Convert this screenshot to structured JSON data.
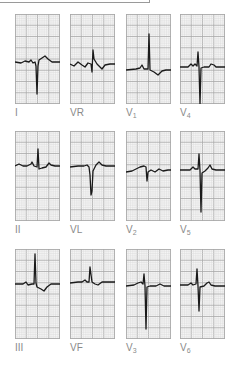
{
  "figure": {
    "grid_color_minor": "#d9d9d9",
    "grid_color_major": "#a8a8a8",
    "trace_color": "#1a1a1a",
    "label_color": "#8a8a8a"
  },
  "leads": [
    {
      "id": "I",
      "name": "I",
      "sub": "",
      "x": 15,
      "y": 14,
      "label_y": 108,
      "baseline": 48,
      "trace": "M0,48 L6,49 L10,47 L14,48 L16,46 L18,49 L20,48 L21,52 L22,80 L23,52 L24,46 L27,44 L30,42 L33,45 L37,48 L45,48"
    },
    {
      "id": "VR",
      "name": "VR",
      "sub": "",
      "x": 70,
      "y": 14,
      "label_y": 108,
      "baseline": 50,
      "trace": "M0,50 L4,52 L8,48 L12,51 L15,53 L18,49 L21,50 L22,58 L23,36 L24,45 L27,50 L32,55 L35,51 L40,50 L45,50"
    },
    {
      "id": "V1",
      "name": "V",
      "sub": "1",
      "x": 126,
      "y": 14,
      "label_y": 108,
      "baseline": 55,
      "trace": "M0,56 L10,55 L14,54 L16,51 L18,55 L22,55 L23,20 L24,56 L28,58 L32,61 L36,57 L40,56 L45,56"
    },
    {
      "id": "V4",
      "name": "V",
      "sub": "4",
      "x": 180,
      "y": 14,
      "label_y": 108,
      "baseline": 53,
      "trace": "M0,53 L8,53 L11,50 L13,52 L15,50 L17,52 L18,38 L19,53 L20,90 L21,54 L24,53 L29,53 L31,50 L34,51 L36,53 L45,53"
    },
    {
      "id": "II",
      "name": "II",
      "sub": "",
      "x": 15,
      "y": 131,
      "label_y": 225,
      "baseline": 34,
      "trace": "M0,35 L4,33 L8,35 L12,35 L16,33 L17,31 L19,35 L22,36 L23,18 L24,38 L27,37 L31,36 L34,32 L36,34 L40,35 L45,35"
    },
    {
      "id": "VL",
      "name": "VL",
      "sub": "",
      "x": 70,
      "y": 131,
      "label_y": 225,
      "baseline": 35,
      "trace": "M0,36 L8,35 L14,35 L17,34 L19,36 L20,44 L21,64 L22,60 L23,40 L26,34 L29,31 L32,34 L36,35 L45,35"
    },
    {
      "id": "V2",
      "name": "V",
      "sub": "2",
      "x": 126,
      "y": 131,
      "label_y": 225,
      "baseline": 38,
      "trace": "M0,41 L6,40 L10,38 L14,36 L18,35 L20,36 L21,50 L22,41 L25,39 L29,41 L33,38 L37,40 L42,39 L45,39"
    },
    {
      "id": "V5",
      "name": "V",
      "sub": "5",
      "x": 180,
      "y": 131,
      "label_y": 225,
      "baseline": 38,
      "trace": "M0,39 L10,39 L13,36 L15,38 L18,38 L19,23 L20,40 L21,81 L22,42 L25,40 L28,37 L30,34 L32,38 L36,39 L45,39"
    },
    {
      "id": "III",
      "name": "III",
      "sub": "",
      "x": 15,
      "y": 249,
      "label_y": 343,
      "baseline": 35,
      "trace": "M0,35 L8,35 L11,33 L13,36 L17,35 L19,35 L20,5 L21,34 L22,38 L26,40 L29,42 L32,38 L36,35 L45,35"
    },
    {
      "id": "VF",
      "name": "VF",
      "sub": "",
      "x": 70,
      "y": 249,
      "label_y": 343,
      "baseline": 33,
      "trace": "M0,34 L8,33 L12,33 L15,31 L17,33 L19,33 L20,18 L22,33 L25,35 L28,36 L32,33 L35,33 L45,33"
    },
    {
      "id": "V3",
      "name": "V",
      "sub": "3",
      "x": 126,
      "y": 249,
      "label_y": 343,
      "baseline": 36,
      "trace": "M0,37 L8,36 L12,34 L15,33 L17,35 L18,25 L19,37 L20,80 L21,38 L24,37 L30,37 L34,35 L38,37 L45,37"
    },
    {
      "id": "V6",
      "name": "V",
      "sub": "6",
      "x": 180,
      "y": 249,
      "label_y": 343,
      "baseline": 35,
      "trace": "M0,36 L8,36 L11,34 L13,36 L16,35 L17,20 L18,37 L19,62 L20,38 L24,37 L27,34 L29,33 L31,36 L35,37 L45,37"
    }
  ]
}
